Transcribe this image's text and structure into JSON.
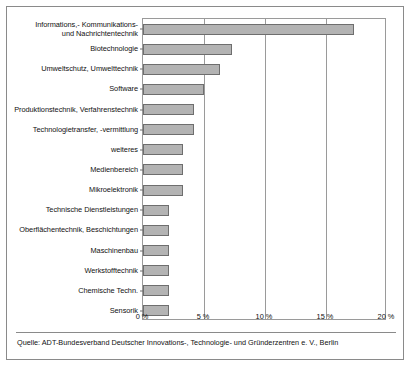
{
  "chart_data": {
    "type": "bar",
    "orientation": "horizontal",
    "title": "",
    "subtitle": "",
    "xlabel": "",
    "ylabel": "",
    "xlim": [
      0,
      20
    ],
    "grid": true,
    "legend": null,
    "xticks": [
      "0 %",
      "5 %",
      "10 %",
      "15 %",
      "20 %"
    ],
    "xtick_values": [
      0,
      5,
      10,
      15,
      20
    ],
    "categories": [
      "Informations,- Kommunikations-\nund Nachrichtentechnik",
      "Biotechnologie",
      "Umweltschutz, Umwelttechnik",
      "Software",
      "Produktionstechnik, Verfahrenstechnik",
      "Technologietransfer, -vermittlung",
      "weiteres",
      "Medienbereich",
      "Mikroelektronik",
      "Technische Dienstleistungen",
      "Oberflächentechnik, Beschichtungen",
      "Maschinenbau",
      "Werkstofftechnik",
      "Chemische Techn.",
      "Sensorik"
    ],
    "values": [
      17.3,
      7.3,
      6.3,
      5.0,
      4.2,
      4.2,
      3.3,
      3.3,
      3.3,
      2.1,
      2.1,
      2.1,
      2.1,
      2.1,
      2.1
    ],
    "bar_color": "#b3b3b3",
    "bar_border_color": "#6e6e6e",
    "axis_color": "#9a9a9a"
  },
  "categories_display": [
    {
      "line1": "Informations,- Kommunikations-",
      "line2": "und Nachrichtentechnik"
    },
    {
      "line1": "Biotechnologie",
      "line2": ""
    },
    {
      "line1": "Umweltschutz, Umwelttechnik",
      "line2": ""
    },
    {
      "line1": "Software",
      "line2": ""
    },
    {
      "line1": "Produktionstechnik, Verfahrenstechnik",
      "line2": ""
    },
    {
      "line1": "Technologietransfer, -vermittlung",
      "line2": ""
    },
    {
      "line1": "weiteres",
      "line2": ""
    },
    {
      "line1": "Medienbereich",
      "line2": ""
    },
    {
      "line1": "Mikroelektronik",
      "line2": ""
    },
    {
      "line1": "Technische Dienstleistungen",
      "line2": ""
    },
    {
      "line1": "Oberflächentechnik, Beschichtungen",
      "line2": ""
    },
    {
      "line1": "Maschinenbau",
      "line2": ""
    },
    {
      "line1": "Werkstofftechnik",
      "line2": ""
    },
    {
      "line1": "Chemische Techn.",
      "line2": ""
    },
    {
      "line1": "Sensorik",
      "line2": ""
    }
  ],
  "footer": {
    "source": "Quelle: ADT-Bundesverband Deutscher Innovations-, Technologie- und Gründerzentren e. V., Berlin"
  }
}
